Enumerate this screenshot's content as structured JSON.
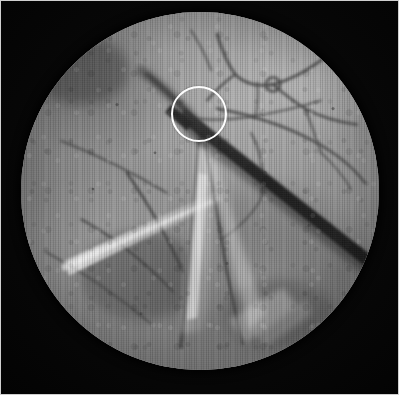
{
  "figure": {
    "domain_label": "Natural-Image",
    "kind": "grayscale medical photograph",
    "modality": "endoscopic / operating-microscope photograph",
    "orientation": "portrait",
    "has_text": false,
    "caption": "",
    "title": ""
  },
  "canvas": {
    "width_px": 399,
    "height_px": 395,
    "background_color": "#000000",
    "border_color": "#cfcfcf",
    "border_width_px": 1
  },
  "field_of_view": {
    "shape": "circle",
    "center_x_px": 200,
    "center_y_px": 190,
    "radius_px": 179,
    "left_px": 21,
    "top_px": 12,
    "diameter_px": 358,
    "cropped_at_top_edge": true,
    "surround_color": "#050505",
    "tissue_mid_tone": "#8d8d8d",
    "tissue_highlight_tone": "#b6b6b6",
    "tissue_shadow_tone": "#6a6a6a",
    "vignette": "dark rim falloff toward aperture edge"
  },
  "annotation": {
    "marker_type": "circle-outline",
    "label": "region-of-interest",
    "color": "#fdfdfd",
    "stroke_width_px": 2,
    "center_x_px": 199,
    "center_y_px": 114,
    "radius_px": 28,
    "encircles": "vessel branch point crossed by the instrument tip"
  },
  "instrument": {
    "label": "dark probe / instrument shaft",
    "color": "#2b2b2b",
    "orientation": "diagonal, upper-left to lower-right",
    "tip_x_px": 188,
    "tip_y_px": 112,
    "end_x_px": 368,
    "end_y_px": 252,
    "width_px": 11
  },
  "features": [
    {
      "name": "vessel-trunk-left",
      "tone": "#4e4e4e",
      "description": "broad dark vessel descending from upper-left toward centre"
    },
    {
      "name": "vessel-branch-network-upper-right",
      "tone": "#3f3f3f",
      "description": "fine branching capillary network in the upper right quadrant"
    },
    {
      "name": "vessel-arcade-right",
      "tone": "#454545",
      "description": "long vessel arcing along the right margin of the field"
    },
    {
      "name": "vessel-convergence-bottom",
      "tone": "#3a3a3a",
      "description": "two vessels converging at the lower centre"
    },
    {
      "name": "specular-highlight-left",
      "tone": "#e4e4e4",
      "description": "bright elongated light reflection in the left-centre region"
    },
    {
      "name": "specular-wedge-centre",
      "tone": "#d8d8d8",
      "description": "bright V-shaped wedge of reflected light below centre"
    },
    {
      "name": "granular-tissue-patch",
      "tone": "#9e9e9e",
      "description": "mottled granular tissue occupying the lower-right quadrant"
    },
    {
      "name": "rim-shadow",
      "tone": "#1a1a1a",
      "description": "circular shadow where the aperture meets the black surround"
    }
  ],
  "palette": {
    "black_surround": "#050505",
    "plate_border": "#cfcfcf",
    "tissue_base": "#8a8a8a",
    "tissue_bright": "#b6b6b6",
    "tissue_dark": "#6e6e6e",
    "vessel_dark": "#3c3c3c",
    "instrument_dark": "#2b2b2b",
    "highlight_white": "#e8e8e8",
    "annotation_white": "#fdfdfd"
  }
}
